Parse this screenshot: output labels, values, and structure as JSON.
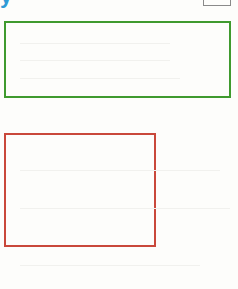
{
  "header": {
    "glyph_text": "y",
    "glyph_color": "#2f9bd6"
  },
  "shapes": [
    {
      "name": "green-rectangle",
      "color": "#3f9a2e",
      "left": 4,
      "top": 21,
      "width": 227,
      "height": 77
    },
    {
      "name": "red-rectangle",
      "color": "#c9483b",
      "left": 4,
      "top": 133,
      "width": 152,
      "height": 114
    }
  ]
}
